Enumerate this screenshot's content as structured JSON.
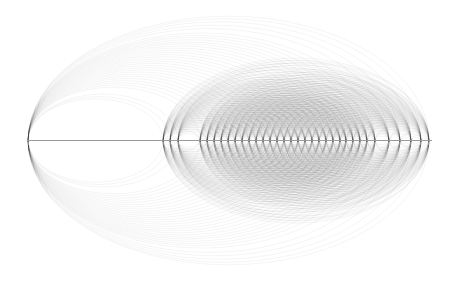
{
  "diagram": {
    "type": "arc-diagram",
    "axis": {
      "y": 140.5,
      "x_start": 27,
      "x_end": 432,
      "color": "#9a9a9a"
    },
    "arc_style": {
      "stroke": "#000000",
      "opacity": 0.09,
      "width": 0.5,
      "height_ratio": 0.62
    },
    "hub_node": {
      "id": "n0",
      "x": 28
    },
    "nodes_x": [
      28,
      163,
      170,
      178,
      200,
      207,
      214,
      221,
      228,
      235,
      242,
      249,
      256,
      263,
      270,
      277,
      284,
      291,
      298,
      305,
      312,
      319,
      326,
      333,
      340,
      346,
      353,
      360,
      367,
      375,
      389,
      400,
      411,
      421,
      429
    ],
    "edge_rules": {
      "hub_to_all": true,
      "dense_cluster_all_pairs": true,
      "dense_cluster_start_index": 1
    }
  }
}
